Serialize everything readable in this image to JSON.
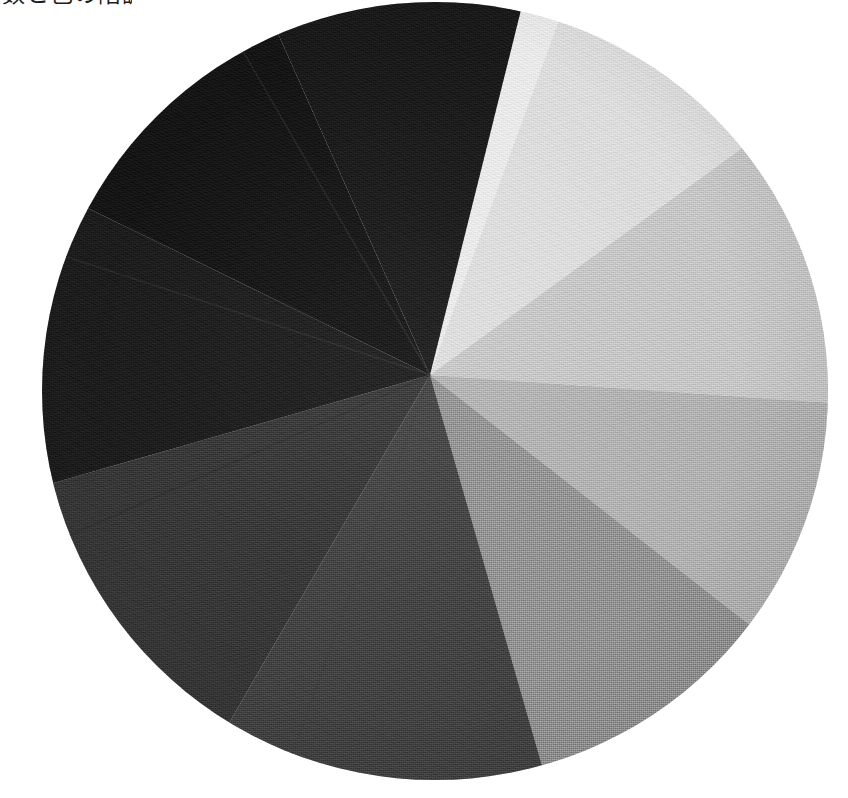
{
  "page": {
    "background_color": "#ffffff",
    "width": 848,
    "height": 798
  },
  "caption": {
    "text": "数と色の階調",
    "note_clipped": "clipped-at-top-edge"
  },
  "artwork": {
    "title": "Grayscale Value Wheel",
    "medium_appearance": "painted canvas with visible woven texture",
    "shape": "circle",
    "center_x": 435,
    "center_y": 391,
    "radius_x": 393,
    "radius_y": 389,
    "convergence_x": 430,
    "convergence_y": 375,
    "segment_count": 10,
    "paper_color": "#ffffff"
  },
  "chart_data": {
    "type": "pie",
    "xlabel": "",
    "ylabel": "",
    "legend_position": "none",
    "grid": false,
    "categories": [
      "Value 1 - White",
      "Value 2 - Near White",
      "Value 3 - Light Gray",
      "Value 4 - Light Mid Gray",
      "Value 5 - Mid Gray",
      "Value 6 - Dark Gray",
      "Value 7 - Deep Gray",
      "Value 8 - Near Black",
      "Value 9 - Black",
      "Value 10 - Darkest Black"
    ],
    "values": [
      46,
      34,
      40,
      34,
      36,
      46,
      44,
      42,
      40,
      38
    ],
    "colors": [
      "#ececec",
      "#dedede",
      "#c6c6c6",
      "#b0b0b0",
      "#8e8e8e",
      "#3c3c3c",
      "#303030",
      "#151515",
      "#0d0d0d",
      "#121212"
    ],
    "segments": [
      {
        "label": "Value 1 - White",
        "start_deg": -26,
        "end_deg": 20,
        "color": "#ececec"
      },
      {
        "label": "Value 2 - Near White",
        "start_deg": 20,
        "end_deg": 54,
        "color": "#dedede"
      },
      {
        "label": "Value 3 - Light Gray",
        "start_deg": 54,
        "end_deg": 94,
        "color": "#c6c6c6"
      },
      {
        "label": "Value 4 - Light Mid Gray",
        "start_deg": 94,
        "end_deg": 128,
        "color": "#b0b0b0"
      },
      {
        "label": "Value 5 - Mid Gray",
        "start_deg": 128,
        "end_deg": 164,
        "color": "#8e8e8e"
      },
      {
        "label": "Value 6 - Dark Gray",
        "start_deg": 164,
        "end_deg": 210,
        "color": "#3c3c3c"
      },
      {
        "label": "Value 7 - Deep Gray",
        "start_deg": 210,
        "end_deg": 254,
        "color": "#303030"
      },
      {
        "label": "Value 8 - Near Black",
        "start_deg": 254,
        "end_deg": 296,
        "color": "#151515"
      },
      {
        "label": "Value 9 - Black",
        "start_deg": 296,
        "end_deg": 336,
        "color": "#0d0d0d"
      },
      {
        "label": "Value 10 - Darkest Black",
        "start_deg": 336,
        "end_deg": 374,
        "color": "#121212"
      }
    ],
    "seams": [
      {
        "deg": 200,
        "tone": "#3a3a3a"
      },
      {
        "deg": 246,
        "tone": "#2a2a2a"
      },
      {
        "deg": 288,
        "tone": "#262626"
      },
      {
        "deg": 330,
        "tone": "#222222"
      }
    ]
  }
}
